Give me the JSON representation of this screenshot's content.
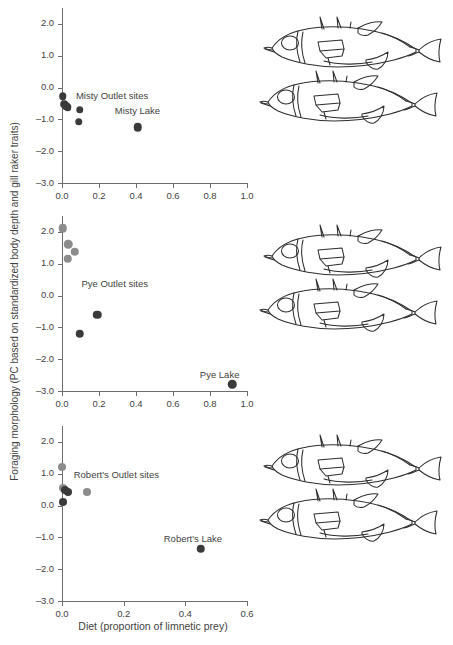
{
  "figure": {
    "xlabel": "Diet (proportion of limnetic prey)",
    "ylabel": "Foraging morphology (PC based on standardized body depth and gill raker traits)",
    "colors": {
      "dark_point": "#3a3a3a",
      "light_point": "#8c8c8c",
      "axis": "#6d6d6d",
      "text": "#3f3f3f",
      "fish_outline": "#2e2e2e"
    }
  },
  "chart_data": [
    {
      "type": "scatter",
      "title": "Misty",
      "xlabel": "Diet (proportion of limnetic prey)",
      "ylabel": "Foraging morphology (PC based on standardized body depth and gill raker traits)",
      "xlim": [
        0.0,
        1.0
      ],
      "ylim": [
        -3.0,
        2.5
      ],
      "xticks": [
        "0.0",
        "0.2",
        "0.4",
        "0.6",
        "0.8",
        "1.0"
      ],
      "xtick_values": [
        0.0,
        0.2,
        0.4,
        0.6,
        0.8,
        1.0
      ],
      "yticks": [
        "2.0",
        "1.0",
        "0.0",
        "-1.0",
        "-2.0",
        "-3.0"
      ],
      "ytick_values": [
        2.0,
        1.0,
        0.0,
        -1.0,
        -2.0,
        -3.0
      ],
      "grid": false,
      "legend": "none",
      "annotations": [
        {
          "text": "Misty Outlet sites",
          "x": 0.075,
          "y": -0.22,
          "align": "left"
        },
        {
          "text": "Misty Lake",
          "x": 0.285,
          "y": -0.72,
          "align": "left"
        }
      ],
      "points": [
        {
          "x": 0.005,
          "y": -0.27,
          "color": "dark",
          "size": 7.5
        },
        {
          "x": 0.012,
          "y": -0.52,
          "color": "dark",
          "size": 7.5
        },
        {
          "x": 0.022,
          "y": -0.58,
          "color": "dark",
          "size": 7.5
        },
        {
          "x": 0.03,
          "y": -0.62,
          "color": "dark",
          "size": 7.5
        },
        {
          "x": 0.095,
          "y": -0.7,
          "color": "dark",
          "size": 7.5
        },
        {
          "x": 0.09,
          "y": -1.08,
          "color": "dark",
          "size": 7.5
        },
        {
          "x": 0.41,
          "y": -1.25,
          "color": "dark",
          "size": 8.5
        }
      ]
    },
    {
      "type": "scatter",
      "title": "Pye",
      "xlabel": "Diet (proportion of limnetic prey)",
      "ylabel": "Foraging morphology (PC based on standardized body depth and gill raker traits)",
      "xlim": [
        0.0,
        1.0
      ],
      "ylim": [
        -3.0,
        2.5
      ],
      "xticks": [
        "0.0",
        "0.2",
        "0.4",
        "0.6",
        "0.8",
        "1.0"
      ],
      "xtick_values": [
        0.0,
        0.2,
        0.4,
        0.6,
        0.8,
        1.0
      ],
      "yticks": [
        "2.0",
        "1.0",
        "0.0",
        "-1.0",
        "-2.0",
        "-3.0"
      ],
      "ytick_values": [
        2.0,
        1.0,
        0.0,
        -1.0,
        -2.0,
        -3.0
      ],
      "grid": false,
      "legend": "none",
      "annotations": [
        {
          "text": "Pye Outlet sites",
          "x": 0.105,
          "y": 0.38,
          "align": "left"
        },
        {
          "text": "Pye Lake",
          "x": 0.745,
          "y": -2.45,
          "align": "left"
        }
      ],
      "points": [
        {
          "x": 0.005,
          "y": 2.12,
          "color": "light",
          "size": 8.5
        },
        {
          "x": 0.035,
          "y": 1.62,
          "color": "light",
          "size": 8.5
        },
        {
          "x": 0.07,
          "y": 1.38,
          "color": "light",
          "size": 8.5
        },
        {
          "x": 0.03,
          "y": 1.15,
          "color": "light",
          "size": 8.5
        },
        {
          "x": 0.19,
          "y": -0.6,
          "color": "dark",
          "size": 8.5
        },
        {
          "x": 0.095,
          "y": -1.2,
          "color": "dark",
          "size": 8.5
        },
        {
          "x": 0.92,
          "y": -2.78,
          "color": "dark",
          "size": 8.5
        }
      ]
    },
    {
      "type": "scatter",
      "title": "Robert's",
      "xlabel": "Diet (proportion of limnetic prey)",
      "ylabel": "Foraging morphology (PC based on standardized body depth and gill raker traits)",
      "xlim": [
        0.0,
        0.6
      ],
      "ylim": [
        -3.0,
        2.5
      ],
      "xticks": [
        "0.0",
        "0.2",
        "0.4",
        "0.6"
      ],
      "xtick_values": [
        0.0,
        0.2,
        0.4,
        0.6
      ],
      "yticks": [
        "2.0",
        "1.0",
        "0.0",
        "-1.0",
        "-2.0",
        "-3.0"
      ],
      "ytick_values": [
        2.0,
        1.0,
        0.0,
        -1.0,
        -2.0,
        -3.0
      ],
      "grid": false,
      "legend": "none",
      "annotations": [
        {
          "text": "Robert's Outlet sites",
          "x": 0.038,
          "y": 0.98,
          "align": "left"
        },
        {
          "text": "Robert's Lake",
          "x": 0.33,
          "y": -1.02,
          "align": "left"
        }
      ],
      "points": [
        {
          "x": 0.001,
          "y": 1.22,
          "color": "light",
          "size": 8.0
        },
        {
          "x": 0.002,
          "y": 0.55,
          "color": "light",
          "size": 8.0
        },
        {
          "x": 0.011,
          "y": 0.5,
          "color": "dark",
          "size": 8.0
        },
        {
          "x": 0.019,
          "y": 0.43,
          "color": "dark",
          "size": 8.0
        },
        {
          "x": 0.08,
          "y": 0.43,
          "color": "light",
          "size": 8.0
        },
        {
          "x": 0.004,
          "y": 0.1,
          "color": "dark",
          "size": 8.0
        },
        {
          "x": 0.45,
          "y": -1.35,
          "color": "dark",
          "size": 8.5
        }
      ]
    }
  ],
  "fish_illustrations": [
    {
      "panel": "Misty",
      "count": 2,
      "species": "threespine-stickleback"
    },
    {
      "panel": "Pye",
      "count": 2,
      "species": "threespine-stickleback"
    },
    {
      "panel": "Robert's",
      "count": 2,
      "species": "threespine-stickleback"
    }
  ]
}
